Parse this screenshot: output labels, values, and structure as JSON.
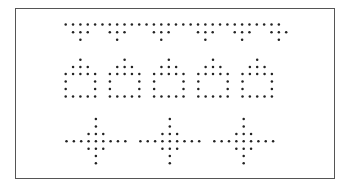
{
  "figure": {
    "frame_color": "#555555",
    "dot_color": "#222222",
    "dot_radius": 1.25,
    "dot_spacing": 7.35,
    "rows": [
      {
        "name": "triangle-border-row",
        "pattern_name": "inverted-triangle-fringe",
        "origin_x": 65.7,
        "row_y": [
          24.5,
          32.3,
          39.7
        ],
        "repeat_count": 1,
        "repeat_dx": 0,
        "grid": [
          "111111111111111111111111111111",
          "0111001110001110001110011100111",
          "0010000100000100000100001000010"
        ]
      },
      {
        "name": "house-row",
        "pattern_name": "house",
        "origin_x": 65.7,
        "row_y": [
          59.7,
          66.9,
          74.1,
          81.4,
          88.9,
          96.5
        ],
        "repeat_count": 5,
        "repeat_dx": 44.2,
        "grid": [
          "00100",
          "01110",
          "11111",
          "10001",
          "10001",
          "11111"
        ]
      },
      {
        "name": "cross-row",
        "pattern_name": "cross",
        "origin_x": 66.5,
        "row_y": [
          119.0,
          126.5,
          134.0,
          141.3,
          148.7,
          156.0,
          163.3
        ],
        "repeat_count": 3,
        "repeat_dx": 73.9,
        "grid": [
          "000010000",
          "000010000",
          "000111000",
          "111111111",
          "000111000",
          "000010000",
          "000010000"
        ]
      }
    ]
  }
}
